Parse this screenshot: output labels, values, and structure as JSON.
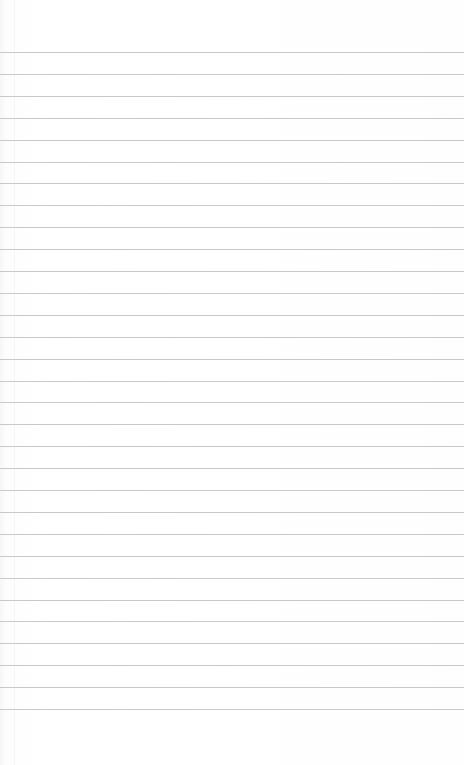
{
  "page": {
    "type": "blank lined paper",
    "background_color": "#fdfdfd",
    "rule_color": "#c9c9c9",
    "rule_count": 31,
    "first_rule_y": 52,
    "rule_spacing": 21.9,
    "text": ""
  }
}
